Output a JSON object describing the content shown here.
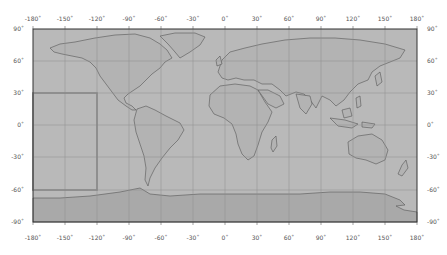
{
  "map": {
    "projection": "equirectangular",
    "frame": {
      "x0": 33,
      "y0": 29,
      "x1": 417,
      "y1": 222
    },
    "lon_range": [
      -180,
      180
    ],
    "lat_range": [
      -90,
      90
    ],
    "colors": {
      "ocean": "#b9b9b9",
      "land": "#b5b5b5",
      "antarctica": "#a9a9a9",
      "coast": "#555555",
      "grid": "#8e8e8e",
      "frame": "#333333",
      "highlight": "#8a8a8a"
    },
    "x_tick_labels": [
      "-180˚",
      "-150˚",
      "-120˚",
      "-90˚",
      "-60˚",
      "-30˚",
      "0˚",
      "30˚",
      "60˚",
      "90˚",
      "120˚",
      "150˚",
      "180˚"
    ],
    "y_tick_labels": [
      "90˚",
      "60˚",
      "30˚",
      "0˚",
      "-30˚",
      "-60˚",
      "-90˚"
    ],
    "highlight_box": {
      "lon_min": -180,
      "lon_max": -120,
      "lat_min": -60,
      "lat_max": 30
    }
  }
}
